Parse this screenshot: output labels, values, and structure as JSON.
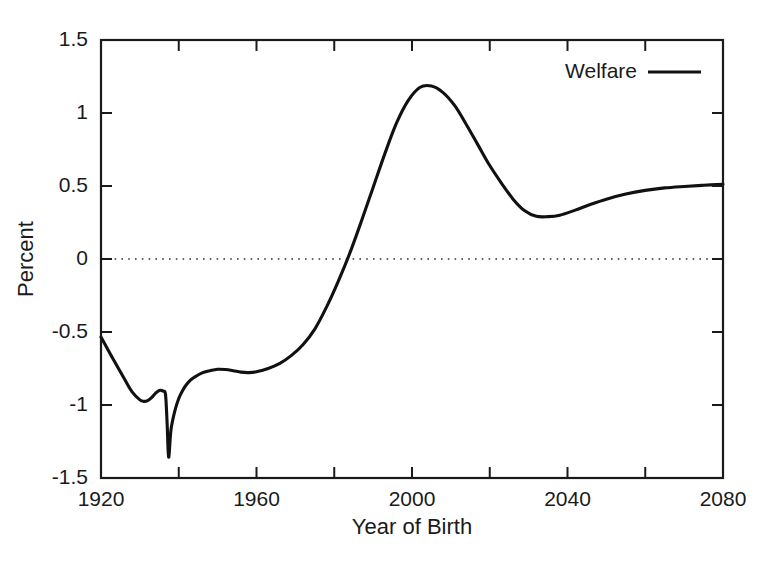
{
  "chart_data": {
    "type": "line",
    "title": "",
    "xlabel": "Year of Birth",
    "ylabel": "Percent",
    "xlim": [
      1920,
      2080
    ],
    "ylim": [
      -1.5,
      1.5
    ],
    "grid": false,
    "zero_reference_line": true,
    "legend": {
      "position": "top-right-inside",
      "entries": [
        {
          "name": "Welfare",
          "color": "#111111",
          "style": "solid"
        }
      ]
    },
    "x_major_ticks": [
      1920,
      1960,
      2000,
      2040,
      2080
    ],
    "x_major_tick_labels": [
      "1920",
      "1960",
      "2000",
      "2040",
      "2080"
    ],
    "x_minor_ticks": [
      1940,
      1980,
      2020,
      2060
    ],
    "y_ticks": [
      -1.5,
      -1,
      -0.5,
      0,
      0.5,
      1,
      1.5
    ],
    "y_tick_labels": [
      "-1.5",
      "-1",
      "-0.5",
      "0",
      "0.5",
      "1",
      "1.5"
    ],
    "series": [
      {
        "name": "Welfare",
        "x": [
          1920,
          1923,
          1926,
          1928,
          1930,
          1931,
          1932,
          1933,
          1934,
          1935,
          1936,
          1936.6,
          1937,
          1937.4,
          1938,
          1939,
          1940,
          1941,
          1942,
          1943,
          1944,
          1946,
          1948,
          1950,
          1952,
          1954,
          1956,
          1958,
          1960,
          1963,
          1966,
          1969,
          1972,
          1975,
          1978,
          1981,
          1984,
          1987,
          1990,
          1993,
          1996,
          1999,
          2002,
          2005,
          2008,
          2011,
          2014,
          2017,
          2020,
          2023,
          2026,
          2029,
          2032,
          2035,
          2038,
          2042,
          2046,
          2050,
          2055,
          2060,
          2065,
          2070,
          2075,
          2080
        ],
        "y": [
          -0.535,
          -0.68,
          -0.82,
          -0.91,
          -0.965,
          -0.975,
          -0.97,
          -0.95,
          -0.92,
          -0.9,
          -0.905,
          -0.93,
          -1.12,
          -1.357,
          -1.17,
          -1.04,
          -0.955,
          -0.9,
          -0.86,
          -0.83,
          -0.81,
          -0.78,
          -0.765,
          -0.755,
          -0.757,
          -0.765,
          -0.775,
          -0.778,
          -0.772,
          -0.75,
          -0.715,
          -0.66,
          -0.585,
          -0.48,
          -0.33,
          -0.155,
          0.04,
          0.26,
          0.49,
          0.72,
          0.93,
          1.085,
          1.175,
          1.185,
          1.14,
          1.05,
          0.92,
          0.78,
          0.64,
          0.52,
          0.41,
          0.33,
          0.292,
          0.29,
          0.3,
          0.335,
          0.375,
          0.41,
          0.445,
          0.47,
          0.487,
          0.497,
          0.505,
          0.512
        ]
      }
    ],
    "annotations": {
      "start_value_1920": -0.535,
      "first_local_min_1931": -0.975,
      "local_bump_1935": -0.9,
      "sharp_spike_min_1937": -1.357,
      "plateau_1950_1960": -0.77,
      "zero_crossing_year": 1981,
      "peak_year": 2005,
      "peak_value": 1.185,
      "post_peak_trough_year": 2033,
      "post_peak_trough_value": 0.29,
      "end_value_2080": 0.512
    }
  }
}
